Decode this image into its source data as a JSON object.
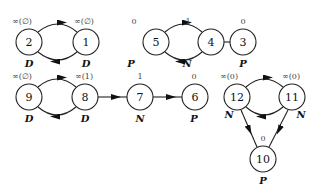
{
  "diagram": {
    "nodes": [
      {
        "id": "2",
        "top": "∞(∅)",
        "type": "D",
        "x": 29,
        "y": 42
      },
      {
        "id": "1",
        "top": "∞(∅)",
        "type": "D",
        "x": 86,
        "y": 42
      },
      {
        "id": "5",
        "top": "0",
        "type": "P",
        "x": 156,
        "y": 42
      },
      {
        "id": "4",
        "top": "1",
        "type": "N",
        "x": 211,
        "y": 42
      },
      {
        "id": "3",
        "top": "0",
        "type": "P",
        "x": 265,
        "y": 42
      },
      {
        "id": "9",
        "top": "∞(∅)",
        "type": "D",
        "x": 29,
        "y": 97
      },
      {
        "id": "8",
        "top": "∞(1)",
        "type": "D",
        "x": 85,
        "y": 97
      },
      {
        "id": "7",
        "top": "1",
        "type": "N",
        "x": 140,
        "y": 97
      },
      {
        "id": "6",
        "top": "0",
        "type": "P",
        "x": 195,
        "y": 97
      },
      {
        "id": "12",
        "top": "∞(0)",
        "type": "N",
        "x": 237,
        "y": 97
      },
      {
        "id": "11",
        "top": "∞(0)",
        "type": "N",
        "x": 292,
        "y": 97
      },
      {
        "id": "10",
        "top": "0",
        "type": "P",
        "x": 263,
        "y": 159
      }
    ],
    "edges": [
      {
        "from": "2",
        "to": "1"
      },
      {
        "from": "1",
        "to": "2"
      },
      {
        "from": "5",
        "to": "4"
      },
      {
        "from": "4",
        "to": "5"
      },
      {
        "from": "4",
        "to": "3"
      },
      {
        "from": "9",
        "to": "8"
      },
      {
        "from": "8",
        "to": "9"
      },
      {
        "from": "8",
        "to": "7"
      },
      {
        "from": "7",
        "to": "6"
      },
      {
        "from": "12",
        "to": "11"
      },
      {
        "from": "11",
        "to": "12"
      },
      {
        "from": "12",
        "to": "10"
      },
      {
        "from": "11",
        "to": "10"
      }
    ]
  },
  "labels": {
    "n2": {
      "id": "2",
      "top": "∞(∅)",
      "type": "D"
    },
    "n1": {
      "id": "1",
      "top": "∞(∅)",
      "type": "D"
    },
    "n5": {
      "id": "5",
      "top": "0",
      "type": "P"
    },
    "n4": {
      "id": "4",
      "top": "1",
      "type": "N"
    },
    "n3": {
      "id": "3",
      "top": "0",
      "type": "P"
    },
    "n9": {
      "id": "9",
      "top": "∞(∅)",
      "type": "D"
    },
    "n8": {
      "id": "8",
      "top": "∞(1)",
      "type": "D"
    },
    "n7": {
      "id": "7",
      "top": "1",
      "type": "N"
    },
    "n6": {
      "id": "6",
      "top": "0",
      "type": "P"
    },
    "n12": {
      "id": "12",
      "top": "∞(0)",
      "type": "N"
    },
    "n11": {
      "id": "11",
      "top": "∞(0)",
      "type": "N"
    },
    "n10": {
      "id": "10",
      "top": "0",
      "type": "P"
    }
  }
}
